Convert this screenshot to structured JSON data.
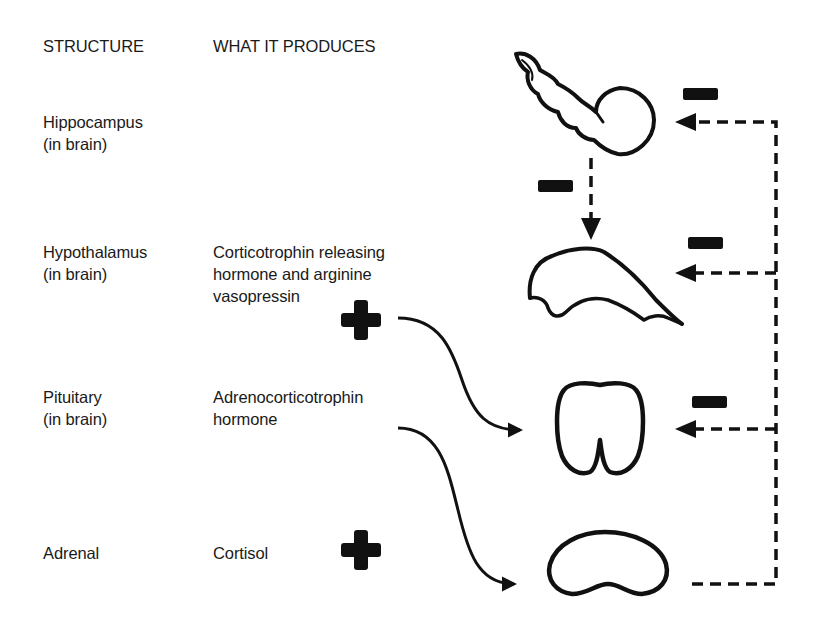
{
  "headers": {
    "structure": "STRUCTURE",
    "produces": "WHAT IT PRODUCES"
  },
  "rows": [
    {
      "structure_line1": "Hippocampus",
      "structure_line2": "(in brain)",
      "produces_line1": "",
      "produces_line2": "",
      "produces_line3": ""
    },
    {
      "structure_line1": "Hypothalamus",
      "structure_line2": "(in brain)",
      "produces_line1": "Corticotrophin releasing",
      "produces_line2": "hormone and arginine",
      "produces_line3": "vasopressin"
    },
    {
      "structure_line1": "Pituitary",
      "structure_line2": "(in brain)",
      "produces_line1": "Adrenocorticotrophin",
      "produces_line2": "hormone",
      "produces_line3": ""
    },
    {
      "structure_line1": "Adrenal",
      "structure_line2": "",
      "produces_line1": "Cortisol",
      "produces_line2": "",
      "produces_line3": ""
    }
  ],
  "symbols": {
    "plus": "+",
    "minus": "−"
  },
  "colors": {
    "ink": "#111111",
    "text": "#1a1a1a",
    "background": "#ffffff"
  },
  "relationships": [
    {
      "from": "Hypothalamus",
      "to": "Pituitary",
      "type": "stimulates",
      "sign": "+"
    },
    {
      "from": "Pituitary",
      "to": "Adrenal",
      "type": "stimulates",
      "sign": "+"
    },
    {
      "from": "Adrenal (Cortisol)",
      "to": "Hippocampus",
      "type": "negative feedback",
      "sign": "−"
    },
    {
      "from": "Adrenal (Cortisol)",
      "to": "Hypothalamus",
      "type": "negative feedback",
      "sign": "−"
    },
    {
      "from": "Adrenal (Cortisol)",
      "to": "Pituitary",
      "type": "negative feedback",
      "sign": "−"
    },
    {
      "from": "Hippocampus",
      "to": "Hypothalamus",
      "type": "inhibits",
      "sign": "−"
    }
  ]
}
